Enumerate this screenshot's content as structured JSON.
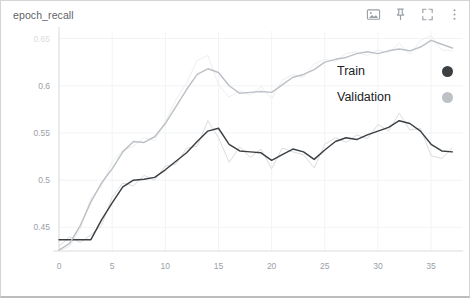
{
  "card": {
    "title": "epoch_recall",
    "border_color": "#d4d4d4",
    "background": "#ffffff"
  },
  "toolbar": {
    "items": [
      {
        "name": "image-icon",
        "label": "Toggle image / data table view"
      },
      {
        "name": "pin-icon",
        "label": "Pin card"
      },
      {
        "name": "fullscreen-icon",
        "label": "Expand chart"
      },
      {
        "name": "more-options-icon",
        "label": "More options"
      }
    ]
  },
  "legend": {
    "entries": [
      {
        "label": "Train",
        "color": "#3c4043"
      },
      {
        "label": "Validation",
        "color": "#bdc1c6"
      }
    ]
  },
  "chart_data": {
    "type": "line",
    "title": "epoch_recall",
    "xlabel": "",
    "ylabel": "",
    "xlim": [
      0,
      38
    ],
    "ylim": [
      0.425,
      0.658
    ],
    "xticks": [
      0,
      5,
      10,
      15,
      20,
      25,
      30,
      35
    ],
    "yticks": [
      0.45,
      0.5,
      0.55,
      0.6,
      0.65
    ],
    "ytick_labels": [
      "0.45",
      "0.5",
      "0.55",
      "0.6",
      "0.65"
    ],
    "grid": true,
    "legend_position": "right-inside",
    "smoothing": true,
    "x": [
      0,
      1,
      2,
      3,
      4,
      5,
      6,
      7,
      8,
      9,
      10,
      11,
      12,
      13,
      14,
      15,
      16,
      17,
      18,
      19,
      20,
      21,
      22,
      23,
      24,
      25,
      26,
      27,
      28,
      29,
      30,
      31,
      32,
      33,
      34,
      35,
      36,
      37
    ],
    "series": [
      {
        "name": "Train",
        "color": "#3c4043",
        "raw_color": "#dadce0",
        "values": [
          0.437,
          0.437,
          0.437,
          0.437,
          0.458,
          0.476,
          0.493,
          0.5,
          0.501,
          0.503,
          0.511,
          0.52,
          0.529,
          0.541,
          0.552,
          0.555,
          0.538,
          0.531,
          0.53,
          0.529,
          0.521,
          0.527,
          0.533,
          0.53,
          0.522,
          0.532,
          0.541,
          0.545,
          0.543,
          0.548,
          0.552,
          0.556,
          0.563,
          0.56,
          0.552,
          0.538,
          0.531,
          0.53
        ],
        "raw_values": [
          0.43,
          0.44,
          0.434,
          0.442,
          0.452,
          0.482,
          0.497,
          0.494,
          0.505,
          0.5,
          0.515,
          0.517,
          0.534,
          0.536,
          0.563,
          0.545,
          0.519,
          0.535,
          0.524,
          0.533,
          0.512,
          0.534,
          0.53,
          0.527,
          0.513,
          0.538,
          0.545,
          0.54,
          0.548,
          0.544,
          0.559,
          0.552,
          0.571,
          0.553,
          0.555,
          0.526,
          0.523,
          0.534
        ]
      },
      {
        "name": "Validation",
        "color": "#bdc1c6",
        "raw_color": "#eceff1",
        "values": [
          0.426,
          0.433,
          0.452,
          0.477,
          0.497,
          0.512,
          0.53,
          0.541,
          0.54,
          0.546,
          0.56,
          0.578,
          0.596,
          0.612,
          0.618,
          0.614,
          0.6,
          0.592,
          0.593,
          0.594,
          0.593,
          0.601,
          0.609,
          0.612,
          0.617,
          0.625,
          0.628,
          0.63,
          0.634,
          0.636,
          0.634,
          0.637,
          0.639,
          0.637,
          0.641,
          0.648,
          0.644,
          0.64
        ],
        "raw_values": [
          0.425,
          0.43,
          0.448,
          0.481,
          0.494,
          0.519,
          0.532,
          0.536,
          0.545,
          0.542,
          0.562,
          0.585,
          0.603,
          0.627,
          0.632,
          0.601,
          0.588,
          0.595,
          0.59,
          0.599,
          0.586,
          0.606,
          0.612,
          0.609,
          0.623,
          0.628,
          0.626,
          0.634,
          0.636,
          0.632,
          0.638,
          0.635,
          0.645,
          0.633,
          0.648,
          0.653,
          0.638,
          0.637
        ]
      }
    ]
  }
}
